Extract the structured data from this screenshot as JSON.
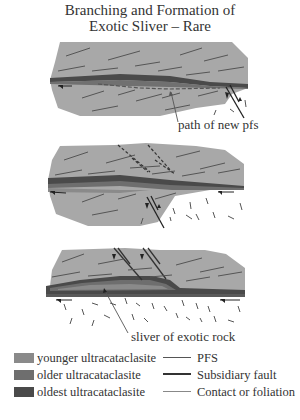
{
  "title": {
    "line1": "Branching and Formation of",
    "line2": "Exotic Sliver – Rare"
  },
  "panels": [
    {
      "id": 1,
      "annotation": "path of new pfs"
    },
    {
      "id": 2,
      "annotation": ""
    },
    {
      "id": 3,
      "annotation": "sliver of exotic rock"
    }
  ],
  "legend": {
    "units": [
      {
        "label": "younger ultracataclasite",
        "color": "#8a8a8a"
      },
      {
        "label": "older ultracataclasite",
        "color": "#6e6e6e"
      },
      {
        "label": "oldest ultracataclasite",
        "color": "#4a4a4a"
      }
    ],
    "lines": [
      {
        "label": "PFS",
        "color": "#555555",
        "width": 1
      },
      {
        "label": "Subsidiary fault",
        "color": "#333333",
        "width": 2
      },
      {
        "label": "Contact or foliation",
        "color": "#777777",
        "width": 1
      }
    ]
  },
  "colors": {
    "block_fill": "#a8a8a8",
    "foliation": "#555555",
    "background": "#ffffff"
  },
  "caption_cutoff": "..."
}
